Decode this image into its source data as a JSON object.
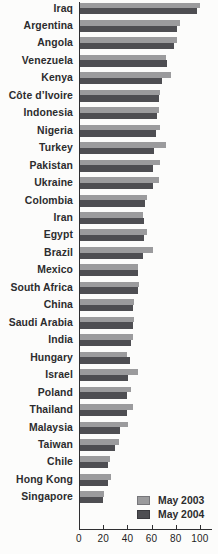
{
  "chart_data": {
    "type": "bar",
    "orientation": "horizontal",
    "title": "",
    "xlabel": "",
    "ylabel": "",
    "xlim": [
      0,
      100
    ],
    "x_ticks": [
      0,
      20,
      40,
      60,
      80,
      100
    ],
    "grid": false,
    "legend_position": "bottom-right",
    "categories": [
      "Iraq",
      "Argentina",
      "Angola",
      "Venezuela",
      "Kenya",
      "Côte d’Ivoire",
      "Indonesia",
      "Nigeria",
      "Turkey",
      "Pakistan",
      "Ukraine",
      "Colombia",
      "Iran",
      "Egypt",
      "Brazil",
      "Mexico",
      "South Africa",
      "China",
      "Saudi Arabia",
      "India",
      "Hungary",
      "Israel",
      "Poland",
      "Thailand",
      "Malaysia",
      "Taiwan",
      "Chile",
      "Hong Kong",
      "Singapore"
    ],
    "series": [
      {
        "name": "May 2003",
        "color": "#9b9b9d",
        "border_color": "#76767a",
        "values": [
          99,
          83,
          80,
          71,
          75,
          66,
          65,
          66,
          71,
          66,
          65,
          55,
          52,
          55,
          60,
          48,
          49,
          45,
          45,
          44,
          39,
          48,
          42,
          44,
          40,
          32,
          25,
          26,
          20
        ]
      },
      {
        "name": "May 2004",
        "color": "#4e4e52",
        "border_color": "#3a3a3e",
        "values": [
          97,
          80,
          78,
          72,
          68,
          65,
          64,
          63,
          61,
          60,
          60,
          54,
          53,
          53,
          52,
          48,
          48,
          44,
          44,
          42,
          41,
          40,
          39,
          39,
          33,
          29,
          23,
          23,
          19
        ]
      }
    ],
    "axis_color": "#2f2f31"
  }
}
